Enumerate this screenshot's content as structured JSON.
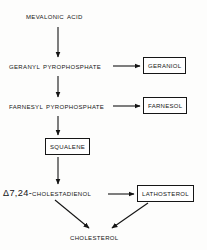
{
  "diagram": {
    "type": "flowchart",
    "line_color": "#141414",
    "background_color": "#fdfdfc",
    "nodes": [
      {
        "id": "mevalonic",
        "label": "Mevalonic acid",
        "boxed": false
      },
      {
        "id": "geranylpp",
        "label": "Geranyl pyrophosphate",
        "boxed": false
      },
      {
        "id": "farnesylpp",
        "label": "Farnesyl pyrophosphate",
        "boxed": false
      },
      {
        "id": "squalene",
        "label": "Squalene",
        "boxed": true
      },
      {
        "id": "cholesta",
        "label": "7,24-Cholestadienol",
        "prefix": "Δ",
        "boxed": false
      },
      {
        "id": "geraniol",
        "label": "Geraniol",
        "boxed": true
      },
      {
        "id": "farnesol",
        "label": "Farnesol",
        "boxed": true
      },
      {
        "id": "lathosterol",
        "label": "Lathosterol",
        "boxed": true
      },
      {
        "id": "cholesterol",
        "label": "Cholesterol",
        "boxed": false
      }
    ],
    "edges": [
      {
        "from": "mevalonic",
        "to": "geranylpp",
        "direction": "down"
      },
      {
        "from": "geranylpp",
        "to": "farnesylpp",
        "direction": "down"
      },
      {
        "from": "farnesylpp",
        "to": "squalene",
        "direction": "down"
      },
      {
        "from": "squalene",
        "to": "cholesta",
        "direction": "down"
      },
      {
        "from": "geranylpp",
        "to": "geraniol",
        "direction": "right"
      },
      {
        "from": "farnesylpp",
        "to": "farnesol",
        "direction": "right"
      },
      {
        "from": "cholesta",
        "to": "lathosterol",
        "direction": "right"
      },
      {
        "from": "cholesta",
        "to": "cholesterol",
        "direction": "diagonal-down-right"
      },
      {
        "from": "lathosterol",
        "to": "cholesterol",
        "direction": "diagonal-down-left"
      }
    ]
  }
}
